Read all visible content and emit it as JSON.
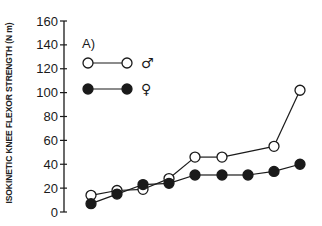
{
  "chart_data": {
    "type": "line",
    "title": "",
    "panel_label": "A)",
    "xlabel": "",
    "ylabel": "ISOKINETIC KNEE FLEXOR STRENGTH (N m)",
    "ylim": [
      0,
      160
    ],
    "yticks": [
      0,
      20,
      40,
      60,
      80,
      100,
      120,
      140,
      160
    ],
    "grid": false,
    "legend_position": "upper-left",
    "x": [
      1,
      2,
      3,
      4,
      5,
      6,
      7,
      8,
      9
    ],
    "series": [
      {
        "name": "♂",
        "marker": "open-circle",
        "values": [
          14,
          18,
          19,
          28,
          46,
          46,
          null,
          55,
          102
        ]
      },
      {
        "name": "♀",
        "marker": "filled-circle",
        "values": [
          7,
          15,
          23,
          24,
          31,
          31,
          31,
          34,
          40
        ]
      }
    ]
  },
  "legend": {
    "male_symbol": "♂",
    "female_symbol": "♀"
  },
  "colors": {
    "ink": "#1a1a1a",
    "background": "#ffffff"
  }
}
